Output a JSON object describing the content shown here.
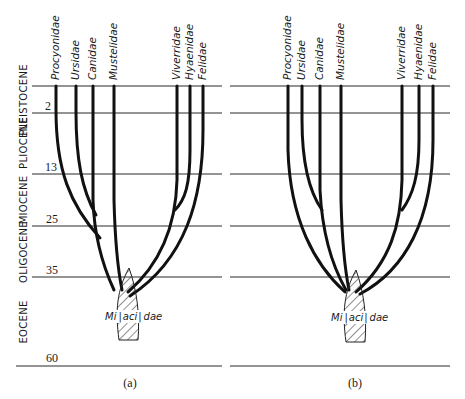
{
  "diagram": {
    "type": "phylogenetic-tree-comparison",
    "epochs": [
      {
        "name": "PLEISTOCENE",
        "top_age": "",
        "bottom_age": "2"
      },
      {
        "name": "PLIOCENE",
        "top_age": "2",
        "bottom_age": "13"
      },
      {
        "name": "MIOCENE",
        "top_age": "13",
        "bottom_age": "25"
      },
      {
        "name": "OLIGOCENE",
        "top_age": "25",
        "bottom_age": "35"
      },
      {
        "name": "EOCENE",
        "top_age": "35",
        "bottom_age": "60"
      }
    ],
    "ages": [
      "2",
      "13",
      "25",
      "35",
      "60"
    ],
    "ancestor": {
      "name_parts": [
        "Mi",
        "aci",
        "dae"
      ],
      "name": "Miacidae"
    },
    "panels": [
      {
        "label": "(a)",
        "taxa": [
          "Procyonidae",
          "Ursidae",
          "Canidae",
          "Mustelidae",
          "Viverridae",
          "Hyaenidae",
          "Felidae"
        ]
      },
      {
        "label": "(b)",
        "taxa": [
          "Procyonidae",
          "Ursidae",
          "Canidae",
          "Mustelidae",
          "Viverridae",
          "Hyaenidae",
          "Felidae"
        ]
      }
    ]
  }
}
